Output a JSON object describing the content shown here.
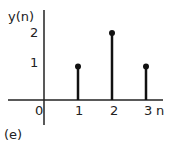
{
  "chart_data": {
    "type": "stem",
    "title": "",
    "xlabel": "n",
    "ylabel": "y(n)",
    "x": [
      1,
      2,
      3
    ],
    "values": [
      1,
      2,
      1
    ],
    "x_ticks": [
      "0",
      "1",
      "2",
      "3"
    ],
    "y_ticks": [
      "1",
      "2"
    ],
    "xlim": [
      -1,
      3.5
    ],
    "ylim": [
      0,
      2.5
    ],
    "grid": false,
    "legend": null,
    "annotation": "(e)"
  },
  "labels": {
    "ylabel": "y(n)",
    "y2": "2",
    "y1": "1",
    "x0": "0",
    "x1": "1",
    "x2": "2",
    "x3": "3",
    "xlabel": "n",
    "caption": "(e)"
  }
}
